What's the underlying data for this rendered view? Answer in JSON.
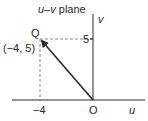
{
  "title": "u–v plane",
  "title_italic_part": "u–v",
  "title_rest": " plane",
  "axes": {
    "horizontal_label": "u",
    "vertical_label": "v",
    "origin_label": "O"
  },
  "point": {
    "name": "Q",
    "coords_label": "(−4, 5)",
    "u": -4,
    "v": 5
  },
  "ticks": {
    "u_tick_label": "−4",
    "v_tick_label": "5"
  },
  "colors": {
    "ink": "#2a2a2a",
    "dash": "#6a6a6a",
    "background": "#ffffff"
  }
}
